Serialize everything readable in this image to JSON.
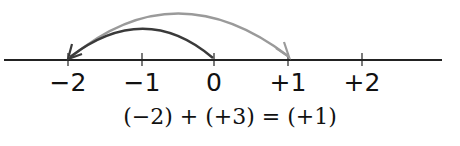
{
  "diagram": {
    "type": "number-line",
    "ticks": [
      {
        "value": -2,
        "label": "−2",
        "x": 68
      },
      {
        "value": -1,
        "label": "−1",
        "x": 142
      },
      {
        "value": 0,
        "label": "0",
        "x": 214
      },
      {
        "value": 1,
        "label": "+1",
        "x": 288
      },
      {
        "value": 2,
        "label": "+2",
        "x": 362
      }
    ],
    "arrows": [
      {
        "name": "dark-arrow",
        "from": 0,
        "to": -2,
        "color": "#3a3a3a"
      },
      {
        "name": "gray-arrow",
        "from": -2,
        "to": 1,
        "color": "#9a9a9a"
      }
    ],
    "equation": "(−2) + (+3) = (+1)"
  }
}
